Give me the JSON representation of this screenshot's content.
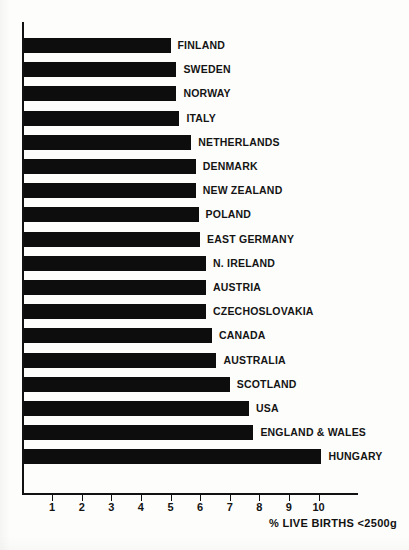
{
  "chart_data": {
    "type": "bar",
    "orientation": "horizontal",
    "title": "",
    "subtitle": "",
    "xlabel": "% LIVE BIRTHS <2500g",
    "ylabel": "",
    "xlim": [
      0,
      11
    ],
    "xticks": [
      1,
      2,
      3,
      4,
      5,
      6,
      7,
      8,
      9,
      10
    ],
    "xtick_labels": [
      "1",
      "2",
      "3",
      "4",
      "5",
      "6",
      "7",
      "8",
      "9",
      "10"
    ],
    "grid": false,
    "legend": null,
    "bar_color": "#0d0d0d",
    "background_color": "#fdfdfb",
    "axis_color": "#111111",
    "categories": [
      "FINLAND",
      "SWEDEN",
      "NORWAY",
      "ITALY",
      "NETHERLANDS",
      "DENMARK",
      "NEW ZEALAND",
      "POLAND",
      "EAST GERMANY",
      "N. IRELAND",
      "AUSTRIA",
      "CZECHOSLOVAKIA",
      "CANADA",
      "AUSTRALIA",
      "SCOTLAND",
      "USA",
      "ENGLAND & WALES",
      "HUNGARY"
    ],
    "values": [
      5.0,
      5.2,
      5.2,
      5.3,
      5.7,
      5.85,
      5.85,
      5.95,
      6.0,
      6.2,
      6.2,
      6.2,
      6.4,
      6.55,
      7.0,
      7.65,
      7.8,
      10.1
    ],
    "bars": [
      {
        "label": "FINLAND",
        "value": 5.0
      },
      {
        "label": "SWEDEN",
        "value": 5.2
      },
      {
        "label": "NORWAY",
        "value": 5.2
      },
      {
        "label": "ITALY",
        "value": 5.3
      },
      {
        "label": "NETHERLANDS",
        "value": 5.7
      },
      {
        "label": "DENMARK",
        "value": 5.85
      },
      {
        "label": "NEW ZEALAND",
        "value": 5.85
      },
      {
        "label": "POLAND",
        "value": 5.95
      },
      {
        "label": "EAST GERMANY",
        "value": 6.0
      },
      {
        "label": "N. IRELAND",
        "value": 6.2
      },
      {
        "label": "AUSTRIA",
        "value": 6.2
      },
      {
        "label": "CZECHOSLOVAKIA",
        "value": 6.2
      },
      {
        "label": "CANADA",
        "value": 6.4
      },
      {
        "label": "AUSTRALIA",
        "value": 6.55
      },
      {
        "label": "SCOTLAND",
        "value": 7.0
      },
      {
        "label": "USA",
        "value": 7.65
      },
      {
        "label": "ENGLAND & WALES",
        "value": 7.8
      },
      {
        "label": "HUNGARY",
        "value": 10.1
      }
    ]
  },
  "layout": {
    "origin_x_px": 22.5,
    "px_per_unit": 29.6,
    "first_bar_top_px": 38,
    "bar_pitch_px": 24.2,
    "bar_height_px": 15,
    "tick_baseline_y_px": 493
  }
}
